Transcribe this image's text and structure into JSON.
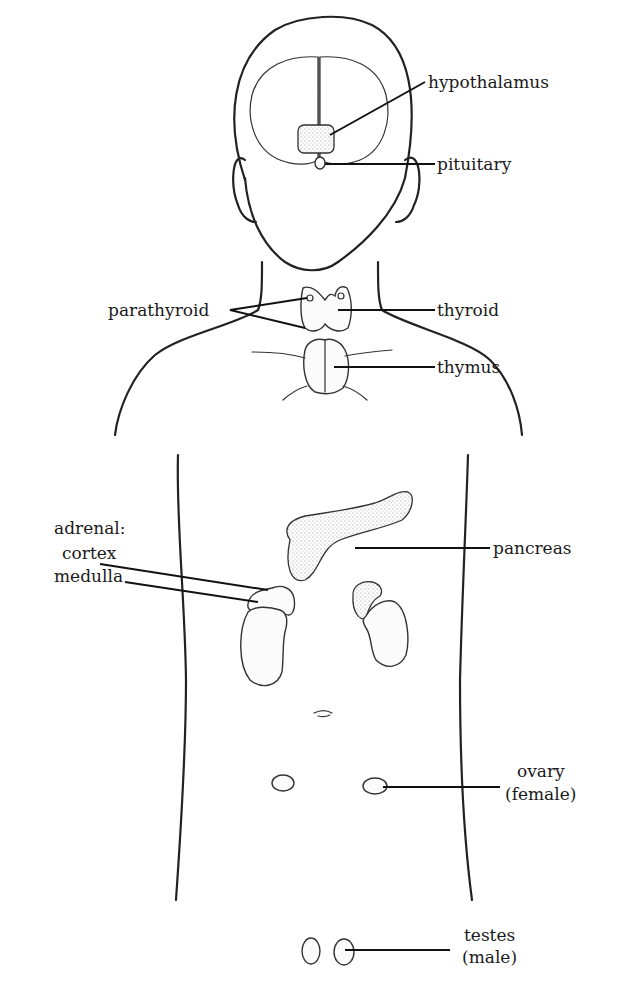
{
  "diagram": {
    "labels": {
      "hypothalamus": "hypothalamus",
      "pituitary": "pituitary",
      "parathyroid": "parathyroid",
      "thyroid": "thyroid",
      "thymus": "thymus",
      "adrenal": "adrenal:",
      "cortex": "cortex",
      "medulla": "medulla",
      "pancreas": "pancreas",
      "ovary": "ovary",
      "ovary_note": "(female)",
      "testes": "testes",
      "testes_note": "(male)"
    }
  }
}
